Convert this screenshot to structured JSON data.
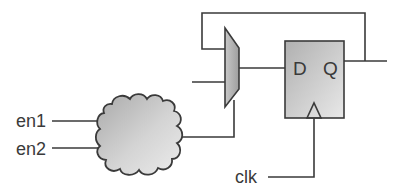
{
  "diagram": {
    "inputs": [
      {
        "label": "en1"
      },
      {
        "label": "en2"
      },
      {
        "label": "clk"
      }
    ],
    "logic_cloud": {
      "name": "combinational logic"
    },
    "mux": {
      "name": "multiplexer",
      "inputs": 2
    },
    "flip_flop": {
      "d_label": "D",
      "q_label": "Q"
    },
    "colors": {
      "line": "#3a3a3a",
      "fill_light": "#e6e6e6",
      "fill_dark": "#a8a8a8"
    }
  }
}
